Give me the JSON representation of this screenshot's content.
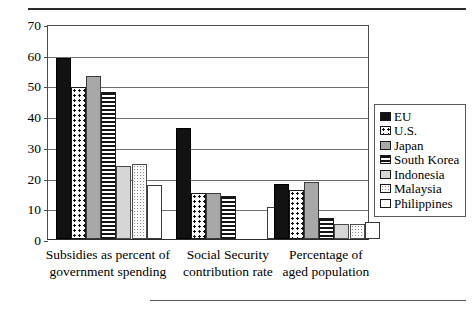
{
  "chart_data": {
    "type": "bar",
    "title": "",
    "subtitle": "",
    "xlabel": "",
    "ylabel": "",
    "ylim": [
      0,
      70
    ],
    "yticks": [
      0,
      10,
      20,
      30,
      40,
      50,
      60,
      70
    ],
    "grid": true,
    "legend_position": "right",
    "categories": [
      "Subsidies as percent of\ngovernment spending",
      "Social Security\ncontribution rate",
      "Percentage of\naged population"
    ],
    "series": [
      {
        "name": "EU",
        "pattern": "solid-black",
        "values": [
          59,
          36,
          18
        ]
      },
      {
        "name": "U.S.",
        "pattern": "polka-dot",
        "values": [
          49.5,
          15,
          16
        ]
      },
      {
        "name": "Japan",
        "pattern": "solid-gray",
        "values": [
          53,
          15,
          18.5
        ]
      },
      {
        "name": "South Korea",
        "pattern": "horizontal-lines",
        "values": [
          48,
          14,
          7
        ]
      },
      {
        "name": "Indonesia",
        "pattern": "light-gray",
        "values": [
          23.7,
          0,
          5
        ]
      },
      {
        "name": "Malaysia",
        "pattern": "speckle",
        "values": [
          24.3,
          0,
          5
        ]
      },
      {
        "name": "Philippines",
        "pattern": "white",
        "values": [
          17.5,
          10.5,
          5.5
        ]
      }
    ]
  },
  "legend": {
    "entries": [
      {
        "label": "EU"
      },
      {
        "label": "U.S."
      },
      {
        "label": "Japan"
      },
      {
        "label": "South Korea"
      },
      {
        "label": "Indonesia"
      },
      {
        "label": "Malaysia"
      },
      {
        "label": "Philippines"
      }
    ]
  },
  "colors": {
    "eu": "#121212",
    "japan": "#a8a8a8",
    "indonesia": "#d6d6d6",
    "axis": "#4a4a4a",
    "gridline": "#6f6f6f",
    "background": "#ffffff"
  }
}
